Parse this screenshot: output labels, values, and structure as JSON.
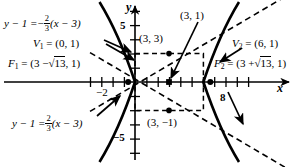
{
  "figure": {
    "type": "hyperbola-graph",
    "title": "",
    "center": [
      3,
      1
    ],
    "a": 3,
    "b": 2,
    "orientation": "horizontal"
  },
  "axes": {
    "x_axis_label": "x",
    "y_axis_label": "y",
    "x_ticks_labeled": [
      {
        "value": -2,
        "text": "−2"
      },
      {
        "value": 8,
        "text": "8"
      }
    ],
    "y_ticks_labeled": [
      {
        "value": 5,
        "text": "5"
      },
      {
        "value": -5,
        "text": "−5"
      }
    ],
    "x_range": [
      -3,
      9
    ],
    "y_range": [
      -6,
      6
    ],
    "grid": false
  },
  "points": [
    {
      "name": "vertex-1",
      "label_lead": "V",
      "label_sub": "1",
      "coords_text": "(0, 1)",
      "x": 0,
      "y": 1
    },
    {
      "name": "vertex-2",
      "label_lead": "V",
      "label_sub": "2",
      "coords_text": "(6, 1)",
      "x": 6,
      "y": 1
    },
    {
      "name": "focus-1",
      "label_lead": "F",
      "label_sub": "1",
      "coords_text": "(3 − √13, 1)",
      "x": -0.606,
      "y": 1
    },
    {
      "name": "focus-2",
      "label_lead": "F",
      "label_sub": "2",
      "coords_text": "(3 + √13, 1)",
      "x": 6.606,
      "y": 1
    },
    {
      "name": "center-point",
      "coords_text": "(3, 1)",
      "x": 3,
      "y": 1
    },
    {
      "name": "upper-corner-point",
      "coords_text": "(3, 3)",
      "x": 3,
      "y": 3
    },
    {
      "name": "lower-corner-point",
      "coords_text": "(3, −1)",
      "x": 3,
      "y": -1
    }
  ],
  "labels": {
    "v1_eq": "=",
    "v2_eq": "=",
    "f1_eq": "=",
    "f2_eq": "=",
    "v1_coords": "(0, 1)",
    "v2_coords": "(6, 1)",
    "f1_open": "(3 −",
    "f1_radicand": "13",
    "f1_close": ", 1)",
    "f2_open": "(3 +",
    "f2_radicand": "13",
    "f2_close": ", 1)",
    "pt_3_3": "(3, 3)",
    "pt_3_1": "(3, 1)",
    "pt_3_m1": "(3, −1)",
    "tick_neg2": "−2",
    "tick_8": "8",
    "tick_5": "5",
    "tick_neg5": "−5",
    "axis_x": "x",
    "axis_y": "y"
  },
  "asymptotes": [
    {
      "name": "asymptote-negative-slope",
      "slope": -0.6667,
      "lhs": "y − 1 =",
      "sign": "−",
      "frac_num": "2",
      "frac_den": "3",
      "rhs": "(x − 3)"
    },
    {
      "name": "asymptote-positive-slope",
      "slope": 0.6667,
      "lhs": "y − 1 =",
      "sign": "",
      "frac_num": "2",
      "frac_den": "3",
      "rhs": "(x − 3)"
    }
  ],
  "colors": {
    "ink": "#000000",
    "background": "#ffffff"
  }
}
